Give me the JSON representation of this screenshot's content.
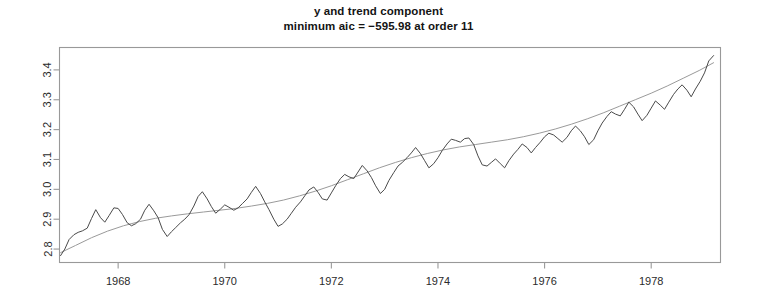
{
  "title": {
    "line1": "y and trend component",
    "line2": "minimum aic = −595.98  at order 11"
  },
  "chart_data": {
    "type": "line",
    "title": "y and trend component",
    "subtitle": "minimum aic = −595.98  at order 11",
    "xlabel": "",
    "ylabel": "",
    "xlim": [
      1966.9,
      1979.3
    ],
    "ylim": [
      2.755,
      3.475
    ],
    "grid": false,
    "legend": null,
    "xticks": [
      1968,
      1970,
      1972,
      1974,
      1976,
      1978
    ],
    "xticklabels": [
      "1968",
      "1970",
      "1972",
      "1974",
      "1976",
      "1978"
    ],
    "yticks": [
      2.8,
      2.9,
      3.0,
      3.1,
      3.2,
      3.3,
      3.4
    ],
    "yticklabels": [
      "2.8",
      "2.9",
      "3.0",
      "3.1",
      "3.2",
      "3.3",
      "3.4"
    ],
    "series": [
      {
        "name": "y",
        "color": "#4a4a4a",
        "width": 1.0,
        "x": [
          1966.92,
          1967.0,
          1967.08,
          1967.17,
          1967.25,
          1967.33,
          1967.42,
          1967.5,
          1967.58,
          1967.67,
          1967.75,
          1967.83,
          1967.92,
          1968.0,
          1968.08,
          1968.17,
          1968.25,
          1968.33,
          1968.42,
          1968.5,
          1968.58,
          1968.67,
          1968.75,
          1968.83,
          1968.92,
          1969.0,
          1969.08,
          1969.17,
          1969.25,
          1969.33,
          1969.42,
          1969.5,
          1969.58,
          1969.67,
          1969.75,
          1969.83,
          1969.92,
          1970.0,
          1970.08,
          1970.17,
          1970.25,
          1970.33,
          1970.42,
          1970.5,
          1970.58,
          1970.67,
          1970.75,
          1970.83,
          1970.92,
          1971.0,
          1971.08,
          1971.17,
          1971.25,
          1971.33,
          1971.42,
          1971.5,
          1971.58,
          1971.67,
          1971.75,
          1971.83,
          1971.92,
          1972.0,
          1972.08,
          1972.17,
          1972.25,
          1972.33,
          1972.42,
          1972.5,
          1972.58,
          1972.67,
          1972.75,
          1972.83,
          1972.92,
          1973.0,
          1973.08,
          1973.17,
          1973.25,
          1973.33,
          1973.42,
          1973.5,
          1973.58,
          1973.67,
          1973.75,
          1973.83,
          1973.92,
          1974.0,
          1974.08,
          1974.17,
          1974.25,
          1974.33,
          1974.42,
          1974.5,
          1974.58,
          1974.67,
          1974.75,
          1974.83,
          1974.92,
          1975.0,
          1975.08,
          1975.17,
          1975.25,
          1975.33,
          1975.42,
          1975.5,
          1975.58,
          1975.67,
          1975.75,
          1975.83,
          1975.92,
          1976.0,
          1976.08,
          1976.17,
          1976.25,
          1976.33,
          1976.42,
          1976.5,
          1976.58,
          1976.67,
          1976.75,
          1976.83,
          1976.92,
          1977.0,
          1977.08,
          1977.17,
          1977.25,
          1977.33,
          1977.42,
          1977.5,
          1977.58,
          1977.67,
          1977.75,
          1977.83,
          1977.92,
          1978.0,
          1978.08,
          1978.17,
          1978.25,
          1978.33,
          1978.42,
          1978.5,
          1978.58,
          1978.67,
          1978.75,
          1978.83,
          1978.92,
          1979.0,
          1979.08,
          1979.17
        ],
        "y": [
          2.778,
          2.8,
          2.832,
          2.848,
          2.856,
          2.861,
          2.87,
          2.902,
          2.932,
          2.905,
          2.89,
          2.912,
          2.938,
          2.936,
          2.916,
          2.888,
          2.878,
          2.885,
          2.9,
          2.93,
          2.95,
          2.928,
          2.905,
          2.866,
          2.842,
          2.858,
          2.872,
          2.888,
          2.9,
          2.915,
          2.944,
          2.976,
          2.992,
          2.968,
          2.942,
          2.92,
          2.934,
          2.948,
          2.94,
          2.93,
          2.938,
          2.952,
          2.968,
          2.99,
          3.01,
          2.986,
          2.958,
          2.932,
          2.9,
          2.876,
          2.884,
          2.9,
          2.92,
          2.94,
          2.958,
          2.978,
          2.998,
          3.008,
          2.99,
          2.968,
          2.964,
          2.988,
          3.012,
          3.036,
          3.05,
          3.042,
          3.036,
          3.058,
          3.08,
          3.062,
          3.04,
          3.012,
          2.986,
          3.0,
          3.03,
          3.056,
          3.078,
          3.09,
          3.106,
          3.122,
          3.14,
          3.12,
          3.096,
          3.072,
          3.086,
          3.106,
          3.13,
          3.152,
          3.168,
          3.164,
          3.158,
          3.17,
          3.172,
          3.15,
          3.112,
          3.082,
          3.078,
          3.09,
          3.102,
          3.086,
          3.072,
          3.096,
          3.118,
          3.134,
          3.152,
          3.14,
          3.122,
          3.14,
          3.158,
          3.176,
          3.188,
          3.182,
          3.17,
          3.158,
          3.174,
          3.196,
          3.212,
          3.196,
          3.176,
          3.15,
          3.166,
          3.196,
          3.222,
          3.244,
          3.26,
          3.252,
          3.246,
          3.268,
          3.292,
          3.276,
          3.252,
          3.23,
          3.248,
          3.272,
          3.296,
          3.282,
          3.268,
          3.292,
          3.318,
          3.336,
          3.35,
          3.332,
          3.31,
          3.336,
          3.362,
          3.39,
          3.43,
          3.448
        ]
      },
      {
        "name": "trend component",
        "color": "#9a9a9a",
        "width": 1.0,
        "x": [
          1966.92,
          1967.2,
          1967.5,
          1967.8,
          1968.1,
          1968.4,
          1968.7,
          1969.0,
          1969.3,
          1969.6,
          1969.9,
          1970.2,
          1970.5,
          1970.8,
          1971.1,
          1971.4,
          1971.7,
          1972.0,
          1972.3,
          1972.6,
          1972.9,
          1973.2,
          1973.5,
          1973.8,
          1974.1,
          1974.4,
          1974.7,
          1975.0,
          1975.3,
          1975.6,
          1975.9,
          1976.2,
          1976.5,
          1976.8,
          1977.1,
          1977.4,
          1977.7,
          1978.0,
          1978.3,
          1978.6,
          1978.9,
          1979.17
        ],
        "y": [
          2.788,
          2.812,
          2.838,
          2.86,
          2.878,
          2.892,
          2.903,
          2.911,
          2.918,
          2.924,
          2.93,
          2.936,
          2.944,
          2.953,
          2.964,
          2.978,
          2.994,
          3.012,
          3.032,
          3.052,
          3.072,
          3.09,
          3.106,
          3.12,
          3.132,
          3.142,
          3.15,
          3.158,
          3.166,
          3.176,
          3.188,
          3.202,
          3.218,
          3.236,
          3.256,
          3.278,
          3.3,
          3.322,
          3.346,
          3.372,
          3.398,
          3.424
        ]
      }
    ]
  },
  "axes": {
    "box_color": "#999999"
  }
}
